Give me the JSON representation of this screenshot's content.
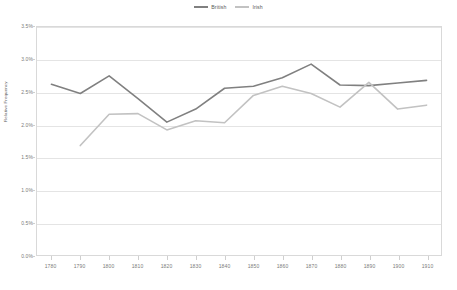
{
  "chart_data": {
    "type": "line",
    "title": "",
    "subtitle": "",
    "xlabel": "",
    "ylabel": "Relative Frequency",
    "x": [
      1780,
      1790,
      1800,
      1810,
      1820,
      1830,
      1840,
      1850,
      1860,
      1870,
      1880,
      1890,
      1900,
      1910
    ],
    "xtick_labels": [
      "1780",
      "1790",
      "1800",
      "1810",
      "1820",
      "1830",
      "1840",
      "1850",
      "1860",
      "1870",
      "1880",
      "1890",
      "1900",
      "1910"
    ],
    "xlim": [
      1775,
      1915
    ],
    "ylim": [
      0.0,
      3.5
    ],
    "ytick_values": [
      3.5,
      3.0,
      2.5,
      2.0,
      1.5,
      1.0,
      0.5,
      0.0
    ],
    "ytick_labels": [
      "3.5%",
      "3.0%",
      "2.5%",
      "2.0%",
      "1.5%",
      "1.0%",
      "0.5%",
      "0.0%"
    ],
    "grid": true,
    "grid_axis": "y",
    "legend_position": "top-center",
    "series": [
      {
        "name": "British",
        "color": "#808080",
        "x": [
          1780,
          1790,
          1800,
          1810,
          1820,
          1830,
          1840,
          1850,
          1860,
          1870,
          1880,
          1890,
          1900,
          1910
        ],
        "values": [
          2.62,
          2.48,
          2.75,
          2.4,
          2.04,
          2.24,
          2.56,
          2.59,
          2.72,
          2.93,
          2.61,
          2.6,
          2.64,
          2.68
        ]
      },
      {
        "name": "Irish",
        "color": "#c2c2c2",
        "x": [
          1790,
          1800,
          1810,
          1820,
          1830,
          1840,
          1850,
          1860,
          1870,
          1880,
          1890,
          1900,
          1910
        ],
        "values": [
          1.68,
          2.16,
          2.17,
          1.92,
          2.06,
          2.03,
          2.45,
          2.59,
          2.48,
          2.27,
          2.65,
          2.24,
          2.3
        ]
      }
    ]
  },
  "legend": {
    "entries": [
      {
        "label": "British",
        "color": "#808080"
      },
      {
        "label": "Irish",
        "color": "#c2c2c2"
      }
    ]
  },
  "axes": {
    "y_title": "Relative Frequency"
  },
  "colors": {
    "british": "#808080",
    "irish": "#c2c2c2",
    "gridline": "#e4e4e4",
    "frame": "#d9d9d9",
    "tick_text": "#7b7b7b"
  }
}
